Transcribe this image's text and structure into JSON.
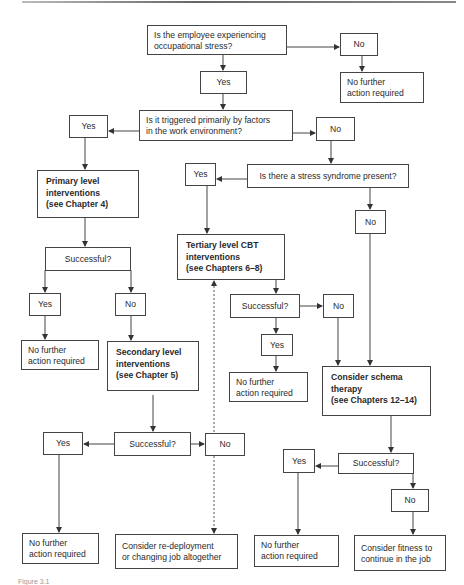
{
  "diagram": {
    "q1": {
      "lines": [
        "Is the employee experiencing",
        "occupational stress?"
      ]
    },
    "q1_yes": "Yes",
    "q1_no": "No",
    "q1_no_result": {
      "lines": [
        "No further",
        "action required"
      ]
    },
    "q2": {
      "lines": [
        "Is it triggered primarily by factors",
        "in the work environment?"
      ]
    },
    "q2_yes": "Yes",
    "q2_no": "No",
    "q3": {
      "lines": [
        "Is there a stress syndrome present?"
      ]
    },
    "q3_yes": "Yes",
    "q3_no": "No",
    "primary": {
      "lines": [
        "Primary level",
        "interventions",
        "(see Chapter 4)"
      ]
    },
    "primary_successful": "Successful?",
    "primary_yes": "Yes",
    "primary_no": "No",
    "primary_yes_result": {
      "lines": [
        "No further",
        "action required"
      ]
    },
    "secondary": {
      "lines": [
        "Secondary level",
        "interventions",
        "(see Chapter 5)"
      ]
    },
    "secondary_successful": "Successful?",
    "secondary_yes": "Yes",
    "secondary_no": "No",
    "secondary_yes_result": {
      "lines": [
        "No further",
        "action required"
      ]
    },
    "secondary_no_result": {
      "lines": [
        "Consider re-deployment",
        "or changing job altogether"
      ]
    },
    "tertiary": {
      "lines": [
        "Tertiary level CBT",
        "interventions",
        "(see Chapters 6–8)"
      ]
    },
    "tertiary_successful": "Successful?",
    "tertiary_yes": "Yes",
    "tertiary_no": "No",
    "tertiary_yes_result": {
      "lines": [
        "No further",
        "action required"
      ]
    },
    "schema": {
      "lines": [
        "Consider schema",
        "therapy",
        "(see Chapters 12–14)"
      ]
    },
    "schema_successful": "Successful?",
    "schema_yes": "Yes",
    "schema_no": "No",
    "schema_yes_result": {
      "lines": [
        "No further",
        "action required"
      ]
    },
    "schema_no_result": {
      "lines": [
        "Consider fitness to",
        "continue in the job"
      ]
    }
  },
  "caption": "Figure 3.1"
}
